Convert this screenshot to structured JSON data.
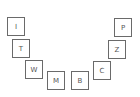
{
  "tiles": [
    {
      "label": "I",
      "x": 7,
      "y": 17
    },
    {
      "label": "T",
      "x": 12,
      "y": 39
    },
    {
      "label": "W",
      "x": 25,
      "y": 60
    },
    {
      "label": "M",
      "x": 47,
      "y": 71
    },
    {
      "label": "B",
      "x": 71,
      "y": 71
    },
    {
      "label": "C",
      "x": 93,
      "y": 61
    },
    {
      "label": "Z",
      "x": 108,
      "y": 40
    },
    {
      "label": "P",
      "x": 114,
      "y": 18
    }
  ]
}
